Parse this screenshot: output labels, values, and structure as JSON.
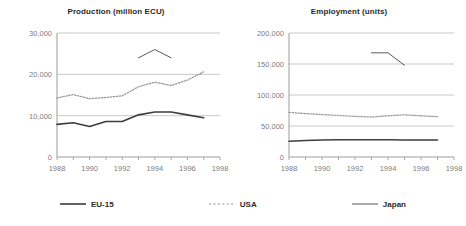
{
  "legend": {
    "position": "bottom",
    "items": [
      {
        "label": "EU-15",
        "style": "solid",
        "color": "#3d3d3d",
        "width": 1.6,
        "icon": "line-swatch-solid-icon"
      },
      {
        "label": "USA",
        "style": "dotted",
        "color": "#9a9a9a",
        "width": 1.2,
        "icon": "line-swatch-dotted-icon"
      },
      {
        "label": "Japan",
        "style": "solid",
        "color": "#5a5a5a",
        "width": 1.0,
        "icon": "line-swatch-thin-icon"
      }
    ]
  },
  "chart_data": [
    {
      "type": "line",
      "id": "production",
      "title": "Production (million ECU)",
      "xlabel": "",
      "ylabel": "",
      "xlim": [
        1988,
        1998
      ],
      "ylim": [
        0,
        30000
      ],
      "grid": true,
      "grid_axis": "y",
      "xticks": [
        1988,
        1989,
        1990,
        1991,
        1992,
        1993,
        1994,
        1995,
        1996,
        1997,
        1998
      ],
      "xticklabels": [
        "1988",
        "",
        "1990",
        "",
        "1992",
        "",
        "1994",
        "",
        "1996",
        "",
        "1998"
      ],
      "yticks": [
        0,
        10000,
        20000,
        30000
      ],
      "yticklabels": [
        "0",
        "10,000",
        "20,000",
        "30,000"
      ],
      "series": [
        {
          "name": "EU-15",
          "style": "solid",
          "color": "#3d3d3d",
          "x": [
            1988,
            1989,
            1990,
            1991,
            1992,
            1993,
            1994,
            1995,
            1996,
            1997
          ],
          "values": [
            7900,
            8300,
            7400,
            8600,
            8600,
            10200,
            10900,
            10900,
            10200,
            9500
          ]
        },
        {
          "name": "USA",
          "style": "dotted",
          "color": "#9a9a9a",
          "x": [
            1988,
            1989,
            1990,
            1991,
            1992,
            1993,
            1994,
            1995,
            1996,
            1997
          ],
          "values": [
            14300,
            15100,
            14100,
            14400,
            14800,
            17000,
            18100,
            17300,
            18600,
            20600
          ]
        },
        {
          "name": "Japan",
          "style": "solid",
          "color": "#5a5a5a",
          "x": [
            1993,
            1994,
            1995
          ],
          "values": [
            24000,
            26000,
            24000
          ]
        }
      ]
    },
    {
      "type": "line",
      "id": "employment",
      "title": "Employment (units)",
      "xlabel": "",
      "ylabel": "",
      "xlim": [
        1988,
        1998
      ],
      "ylim": [
        0,
        200000
      ],
      "grid": true,
      "grid_axis": "y",
      "xticks": [
        1988,
        1989,
        1990,
        1991,
        1992,
        1993,
        1994,
        1995,
        1996,
        1997,
        1998
      ],
      "xticklabels": [
        "1988",
        "",
        "1990",
        "",
        "1992",
        "",
        "1994",
        "",
        "1996",
        "",
        "1998"
      ],
      "yticks": [
        0,
        50000,
        100000,
        150000,
        200000
      ],
      "yticklabels": [
        "0",
        "50,000",
        "100,000",
        "150,000",
        "200,000"
      ],
      "series": [
        {
          "name": "EU-15",
          "style": "solid",
          "color": "#3d3d3d",
          "x": [
            1988,
            1989,
            1990,
            1991,
            1992,
            1993,
            1994,
            1995,
            1996,
            1997
          ],
          "values": [
            25500,
            26500,
            27500,
            27800,
            27800,
            27800,
            27800,
            27500,
            27500,
            27500
          ]
        },
        {
          "name": "USA",
          "style": "dotted",
          "color": "#9a9a9a",
          "x": [
            1988,
            1989,
            1990,
            1991,
            1992,
            1993,
            1994,
            1995,
            1996,
            1997
          ],
          "values": [
            72000,
            70000,
            68500,
            67000,
            65500,
            64500,
            66500,
            68000,
            66500,
            65000
          ]
        },
        {
          "name": "Japan",
          "style": "solid",
          "color": "#5a5a5a",
          "x": [
            1993,
            1994,
            1995
          ],
          "values": [
            168000,
            168000,
            148000
          ]
        }
      ]
    }
  ]
}
